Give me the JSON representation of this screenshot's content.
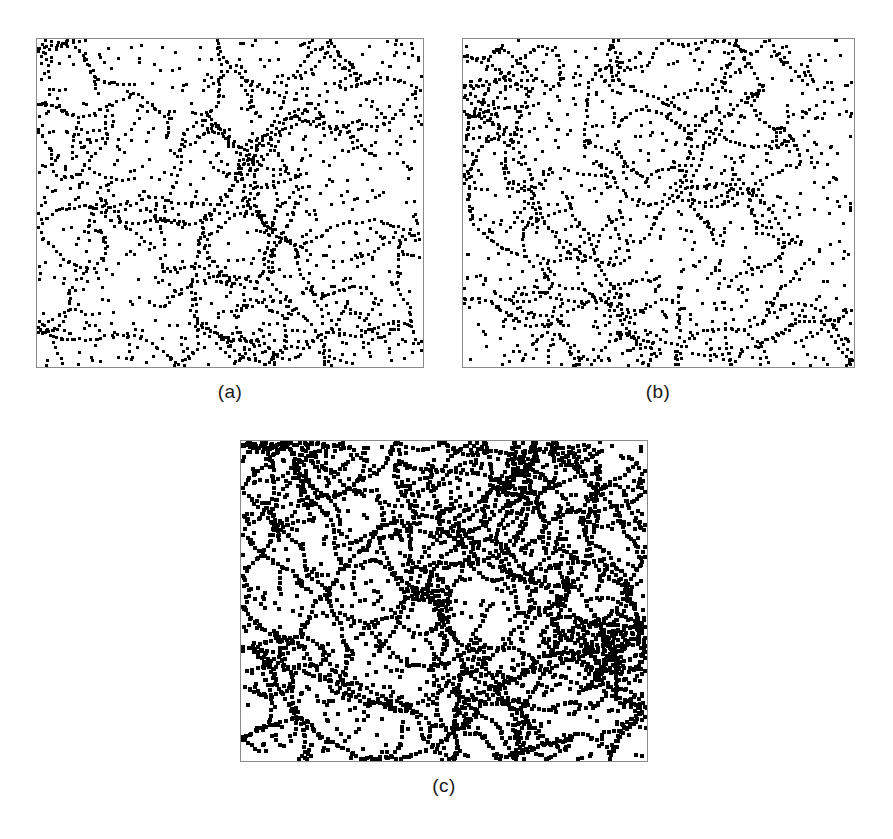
{
  "figure": {
    "background_color": "#ffffff",
    "point_color": "#000000",
    "frame_color": "#8a8a8a",
    "label_color": "#1a1a1a",
    "width": 893,
    "height": 839
  },
  "panels": [
    {
      "label": "(a)",
      "name": "panel-a",
      "x": 36,
      "y": 38,
      "width": 388,
      "height": 330,
      "label_x": 175,
      "label_y": 381,
      "label_width": 110,
      "seed": 1021,
      "n_random": 760,
      "n_filaments": 26,
      "filament_len_min": 14,
      "filament_len_max": 52,
      "dot_size": 3.4,
      "step": 6.0
    },
    {
      "label": "(b)",
      "name": "panel-b",
      "x": 462,
      "y": 38,
      "width": 393,
      "height": 330,
      "label_x": 603,
      "label_y": 381,
      "label_width": 110,
      "seed": 2207,
      "n_random": 780,
      "n_filaments": 28,
      "filament_len_min": 14,
      "filament_len_max": 50,
      "dot_size": 3.4,
      "step": 6.0
    },
    {
      "label": "(c)",
      "name": "panel-c",
      "x": 240,
      "y": 440,
      "width": 408,
      "height": 322,
      "label_x": 389,
      "label_y": 775,
      "label_width": 110,
      "seed": 3313,
      "n_random": 820,
      "n_filaments": 44,
      "filament_len_min": 18,
      "filament_len_max": 72,
      "dot_size": 3.5,
      "step": 5.6
    }
  ],
  "chart_data": {
    "type": "scatter",
    "title": "",
    "xlabel": "",
    "ylabel": "",
    "grid": false,
    "legend": null,
    "panels": [
      {
        "label": "(a)",
        "approx_point_count": 1500,
        "approx_random_points": 760,
        "approx_filament_count": 26,
        "axis_ranges": {
          "x": [
            0,
            1
          ],
          "y": [
            0,
            1
          ]
        }
      },
      {
        "label": "(b)",
        "approx_point_count": 1540,
        "approx_random_points": 780,
        "approx_filament_count": 28,
        "axis_ranges": {
          "x": [
            0,
            1
          ],
          "y": [
            0,
            1
          ]
        }
      },
      {
        "label": "(c)",
        "approx_point_count": 1900,
        "approx_random_points": 820,
        "approx_filament_count": 44,
        "axis_ranges": {
          "x": [
            0,
            1
          ],
          "y": [
            0,
            1
          ]
        }
      }
    ]
  }
}
